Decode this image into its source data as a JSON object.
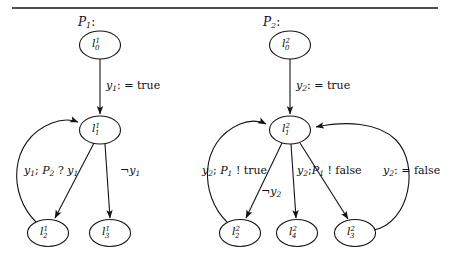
{
  "figure": {
    "kind": "state-transition-diagram",
    "top_rule": true,
    "processes": [
      {
        "id": "P1",
        "title_main": "P",
        "title_sub": "1",
        "title_colon": ":",
        "nodes": [
          {
            "id": "l10",
            "main": "l",
            "sup": "1",
            "sub": "0",
            "cx": 100,
            "cy": 45
          },
          {
            "id": "l11",
            "main": "l",
            "sup": "1",
            "sub": "1",
            "cx": 100,
            "cy": 130
          },
          {
            "id": "l12",
            "main": "l",
            "sup": "1",
            "sub": "2",
            "cx": 48,
            "cy": 233
          },
          {
            "id": "l13",
            "main": "l",
            "sup": "1",
            "sub": "3",
            "cx": 110,
            "cy": 233
          }
        ],
        "edges": [
          {
            "from": "l10",
            "to": "l11",
            "label_parts": [
              {
                "t": "y",
                "k": "i"
              },
              {
                "t": "1",
                "k": "sub"
              },
              {
                "t": ": = true",
                "k": "rom"
              }
            ]
          },
          {
            "from": "l11",
            "to": "l12",
            "label_parts": [
              {
                "t": "y",
                "k": "i"
              },
              {
                "t": "1",
                "k": "sub"
              },
              {
                "t": "; ",
                "k": "rom"
              },
              {
                "t": "P",
                "k": "i"
              },
              {
                "t": "2",
                "k": "sub"
              },
              {
                "t": " ? ",
                "k": "rom"
              },
              {
                "t": "y",
                "k": "i"
              },
              {
                "t": "1",
                "k": "sub"
              }
            ]
          },
          {
            "from": "l11",
            "to": "l13",
            "label_parts": [
              {
                "t": "¬",
                "k": "rom"
              },
              {
                "t": "y",
                "k": "i"
              },
              {
                "t": "1",
                "k": "sub"
              }
            ]
          },
          {
            "from": "l12",
            "to": "l11",
            "label_parts": []
          }
        ]
      },
      {
        "id": "P2",
        "title_main": "P",
        "title_sub": "2",
        "title_colon": ":",
        "nodes": [
          {
            "id": "l20",
            "main": "l",
            "sup": "2",
            "sub": "0",
            "cx": 290,
            "cy": 45
          },
          {
            "id": "l21",
            "main": "l",
            "sup": "2",
            "sub": "1",
            "cx": 290,
            "cy": 130
          },
          {
            "id": "l22",
            "main": "l",
            "sup": "2",
            "sub": "2",
            "cx": 240,
            "cy": 233
          },
          {
            "id": "l24",
            "main": "l",
            "sup": "2",
            "sub": "4",
            "cx": 297,
            "cy": 233
          },
          {
            "id": "l23",
            "main": "l",
            "sup": "2",
            "sub": "3",
            "cx": 355,
            "cy": 233
          }
        ],
        "edges": [
          {
            "from": "l20",
            "to": "l21",
            "label_parts": [
              {
                "t": "y",
                "k": "i"
              },
              {
                "t": "2",
                "k": "sub"
              },
              {
                "t": ": = true",
                "k": "rom"
              }
            ]
          },
          {
            "from": "l21",
            "to": "l22",
            "label_parts": [
              {
                "t": "y",
                "k": "i"
              },
              {
                "t": "2",
                "k": "sub"
              },
              {
                "t": "; ",
                "k": "rom"
              },
              {
                "t": "P",
                "k": "i"
              },
              {
                "t": "1",
                "k": "sub"
              },
              {
                "t": " ! true",
                "k": "rom"
              }
            ]
          },
          {
            "from": "l21",
            "to": "l24",
            "label_parts": [
              {
                "t": "¬",
                "k": "rom"
              },
              {
                "t": "y",
                "k": "i"
              },
              {
                "t": "2",
                "k": "sub"
              }
            ]
          },
          {
            "from": "l21",
            "to": "l23",
            "label_parts": [
              {
                "t": "y",
                "k": "i"
              },
              {
                "t": "2",
                "k": "sub"
              },
              {
                "t": ";",
                "k": "rom"
              },
              {
                "t": "P",
                "k": "i"
              },
              {
                "t": "1",
                "k": "sub"
              },
              {
                "t": " ! false",
                "k": "rom"
              }
            ]
          },
          {
            "from": "l23",
            "to": "l21",
            "label_parts": [
              {
                "t": "y",
                "k": "i"
              },
              {
                "t": "2",
                "k": "sub"
              },
              {
                "t": ": = false",
                "k": "rom"
              }
            ]
          },
          {
            "from": "l22",
            "to": "l21",
            "label_parts": []
          }
        ]
      }
    ],
    "labels": {
      "p1_title": "P1:",
      "p2_title": "P2:",
      "p1_e_init": "y1: = true",
      "p1_e_left": "y1; P2 ? y1",
      "p1_e_right": "¬y1",
      "p2_e_init": "y2: = true",
      "p2_e_left": "y2; P1 ! true",
      "p2_e_mid": "¬y2",
      "p2_e_right": "y2;P1 ! false",
      "p2_e_far": "y2: = false",
      "node_l10": "l10",
      "node_l11": "l11",
      "node_l12": "l12",
      "node_l13": "l13",
      "node_l20": "l20",
      "node_l21": "l21",
      "node_l22": "l22",
      "node_l24": "l24",
      "node_l23": "l23"
    },
    "colors": {
      "ink": "#141414",
      "paper": "#ffffff"
    }
  }
}
